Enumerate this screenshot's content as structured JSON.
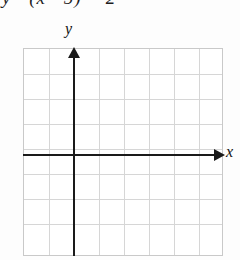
{
  "equation": {
    "lhs": "y",
    "equals": "=",
    "open_paren": "(",
    "variable": "x",
    "minus_1": "−",
    "constant_1": "5",
    "close_paren": ")",
    "exponent": "2",
    "minus_2": "−",
    "constant_2": "2",
    "full_text": "y = (x − 5)² − 2"
  },
  "graph": {
    "y_axis_label": "y",
    "x_axis_label": "x",
    "grid_columns": 8,
    "grid_rows": 8,
    "cell_size_px": 25,
    "origin_column_index": 2,
    "origin_row_index": 4,
    "grid_line_color": "#d6d6d6",
    "grid_border_color": "#c9c9c9",
    "axis_color": "#1a1a1a",
    "background_color": "#ffffff",
    "curve_plotted": false
  },
  "chart_data": {
    "type": "line",
    "xlabel": "x",
    "ylabel": "y",
    "xlim": [
      -2,
      6
    ],
    "ylim": [
      -4,
      4
    ],
    "grid": true,
    "legend": "none",
    "series": [],
    "x": [],
    "values": [],
    "note": "Blank coordinate grid provided for the student to plot the parabola; no curve is drawn in the figure."
  }
}
